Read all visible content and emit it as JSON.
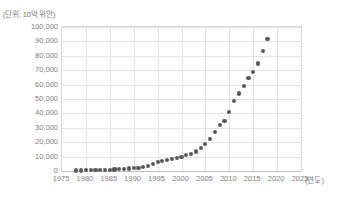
{
  "chart_data": {
    "type": "scatter",
    "title": "",
    "unit_label": "(단위: 10억 위안)",
    "xlabel": "(연도)",
    "ylabel": "",
    "xlim": [
      1975,
      2025
    ],
    "ylim": [
      0,
      100000
    ],
    "grid": true,
    "legend": false,
    "marker_color": "#595959",
    "grid_color": "#e3e3e3",
    "axis_color": "#bfbfbf",
    "xticks": [
      "1975",
      "1980",
      "1985",
      "1990",
      "1995",
      "2000",
      "2005",
      "2010",
      "2015",
      "2020",
      "2025"
    ],
    "xtick_values": [
      1975,
      1980,
      1985,
      1990,
      1995,
      2000,
      2005,
      2010,
      2015,
      2020,
      2025
    ],
    "yticks": [
      "0",
      "10,000",
      "20,000",
      "30,000",
      "40,000",
      "50,000",
      "60,000",
      "70,000",
      "80,000",
      "90,000",
      "100,000"
    ],
    "ytick_values": [
      0,
      10000,
      20000,
      30000,
      40000,
      50000,
      60000,
      70000,
      80000,
      90000,
      100000
    ],
    "x": [
      1978,
      1979,
      1980,
      1981,
      1982,
      1983,
      1984,
      1985,
      1986,
      1987,
      1988,
      1989,
      1990,
      1991,
      1992,
      1993,
      1994,
      1995,
      1996,
      1997,
      1998,
      1999,
      2000,
      2001,
      2002,
      2003,
      2004,
      2005,
      2006,
      2007,
      2008,
      2009,
      2010,
      2011,
      2012,
      2013,
      2014,
      2015,
      2016,
      2017,
      2018
    ],
    "values": [
      367,
      407,
      458,
      489,
      532,
      596,
      721,
      901,
      1028,
      1214,
      1513,
      1718,
      1873,
      2180,
      2694,
      3533,
      4820,
      6079,
      7118,
      7897,
      8440,
      8968,
      9921,
      10966,
      12033,
      13582,
      15988,
      18732,
      21943,
      27009,
      31924,
      34854,
      41211,
      48794,
      53858,
      59296,
      64356,
      68886,
      74640,
      83204,
      91928
    ]
  }
}
